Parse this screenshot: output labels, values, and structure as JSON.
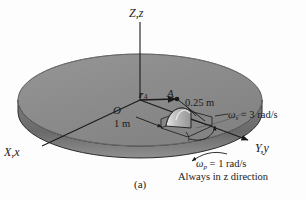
{
  "figure": {
    "caption": "(a)",
    "background_color": "#fdfdfd",
    "disk": {
      "top_color": "#8a8a8a",
      "rim_color": "#6d6d6d",
      "edge_color": "#2b2b2b"
    },
    "line_color": "#1a1a1a"
  },
  "axes": {
    "z_label": "Z,z",
    "x_label": "X,x",
    "y_label": "Y,y",
    "origin_label": "O"
  },
  "annotations": {
    "vector_r_a": "r",
    "vector_r_a_sub": "A",
    "point_a": "A",
    "radius_disk": "1 m",
    "radius_rotor": "0.25 m",
    "omega_spin_symbol": "ω",
    "omega_spin_sub": "s",
    "omega_spin_value": " = 3 rad/s",
    "omega_prec_symbol": "ω",
    "omega_prec_sub": "p",
    "omega_prec_value": " = 1 rad/s",
    "note": "Always in z direction"
  }
}
